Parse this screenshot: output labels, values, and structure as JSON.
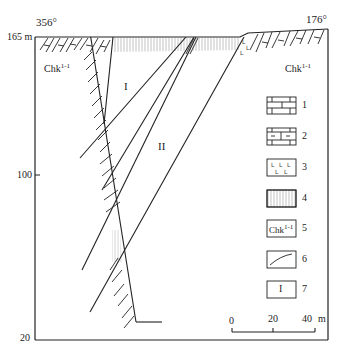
{
  "diagram": {
    "type": "geological-cross-section",
    "azimuth_left": "356°",
    "azimuth_right": "176°",
    "elevation_top": "165 m",
    "elevation_mid": "100",
    "elevation_bottom": "20",
    "formation_left": "Chk",
    "formation_left_sup": "1-1",
    "formation_right": "Chk",
    "formation_right_sup": "1-1",
    "orebody_1": "I",
    "orebody_2": "II"
  },
  "legend": {
    "items": [
      {
        "num": "1",
        "symbol": "limestone-brick-pattern"
      },
      {
        "num": "2",
        "symbol": "argillaceous-limestone-pattern"
      },
      {
        "num": "3",
        "symbol": "volcanic-L-pattern"
      },
      {
        "num": "4",
        "symbol": "vertical-hatch-pattern"
      },
      {
        "num": "5",
        "symbol": "formation-code",
        "text": "Chk",
        "sup": "1-1"
      },
      {
        "num": "6",
        "symbol": "curved-line"
      },
      {
        "num": "7",
        "symbol": "orebody-number",
        "text": "I"
      }
    ]
  },
  "scale_bar": {
    "ticks": [
      "0",
      "20",
      "40"
    ],
    "unit": "m"
  }
}
